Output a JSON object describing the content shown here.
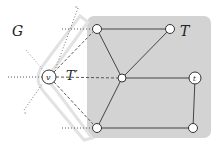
{
  "diagram": {
    "labels": {
      "G": "G",
      "T": "T",
      "T_prime": "T′",
      "v": "v",
      "t": "t",
      "top_tick": "v",
      "bottom_tick": "x"
    },
    "colors": {
      "T_region": "#d3d3d3",
      "T_prime_band": "#e6e6e6",
      "edge": "#444444",
      "node_fill": "#ffffff",
      "node_stroke": "#333333",
      "dotted": "#555555",
      "dashed": "#555555"
    },
    "nodes": [
      {
        "id": "a",
        "x": 97,
        "y": 29,
        "label": ""
      },
      {
        "id": "b",
        "x": 170,
        "y": 29,
        "label": ""
      },
      {
        "id": "c",
        "x": 122,
        "y": 78,
        "label": ""
      },
      {
        "id": "t",
        "x": 195,
        "y": 78,
        "label": "t"
      },
      {
        "id": "d",
        "x": 97,
        "y": 128,
        "label": ""
      },
      {
        "id": "e",
        "x": 193,
        "y": 128,
        "label": ""
      },
      {
        "id": "v",
        "x": 49,
        "y": 77,
        "label": "v"
      }
    ],
    "tree_edges": [
      [
        "a",
        "b"
      ],
      [
        "a",
        "c"
      ],
      [
        "b",
        "c"
      ],
      [
        "c",
        "t"
      ],
      [
        "c",
        "d"
      ],
      [
        "d",
        "e"
      ],
      [
        "e",
        "t"
      ]
    ],
    "dashed_edges": [
      [
        "v",
        "a"
      ],
      [
        "v",
        "c"
      ],
      [
        "v",
        "d"
      ]
    ],
    "dotted_edges": [
      [
        "left_a",
        "a"
      ],
      [
        "left_v",
        "v"
      ],
      [
        "left_d",
        "d"
      ],
      [
        "top",
        "v"
      ],
      [
        "v",
        "bottom"
      ]
    ]
  }
}
